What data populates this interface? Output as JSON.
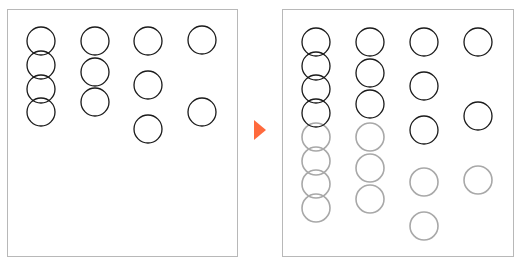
{
  "colors": {
    "background": "#ffffff",
    "panel_border": "#b8b8b8",
    "existing_circle": "#1a1a1a",
    "new_circle": "#a8a8a8",
    "arrow": "#ff6a3d"
  },
  "circle_radius": 14,
  "panels": [
    {
      "name": "before",
      "x": 7,
      "y": 9,
      "width": 230,
      "height": 247,
      "columns": [
        {
          "x": 41,
          "existing": [
            41,
            65,
            89,
            112
          ],
          "new": []
        },
        {
          "x": 95,
          "existing": [
            41,
            72,
            102
          ],
          "new": []
        },
        {
          "x": 148,
          "existing": [
            41,
            85,
            129
          ],
          "new": []
        },
        {
          "x": 202,
          "existing": [
            40,
            112
          ],
          "new": []
        }
      ]
    },
    {
      "name": "after",
      "x": 282,
      "y": 9,
      "width": 231,
      "height": 247,
      "columns": [
        {
          "x": 316,
          "existing": [
            42,
            66,
            89,
            113
          ],
          "new": [
            137,
            161,
            184,
            208
          ]
        },
        {
          "x": 370,
          "existing": [
            42,
            73,
            104
          ],
          "new": [
            137,
            168,
            199
          ]
        },
        {
          "x": 424,
          "existing": [
            42,
            86,
            130
          ],
          "new": [
            182,
            226
          ]
        },
        {
          "x": 478,
          "existing": [
            42,
            116
          ],
          "new": [
            180
          ]
        }
      ]
    }
  ],
  "arrow": {
    "icon": "play-triangle-icon",
    "points": "254,120 266,130 254,140"
  }
}
